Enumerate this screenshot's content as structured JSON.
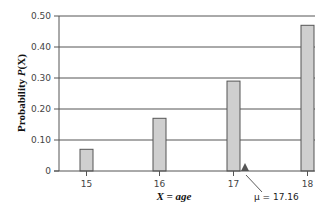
{
  "chart_data": {
    "type": "bar",
    "title": "",
    "xlabel": "X = age",
    "ylabel": "Probability P(X)",
    "categories": [
      "15",
      "16",
      "17",
      "18"
    ],
    "values": [
      0.07,
      0.17,
      0.29,
      0.47
    ],
    "ylim": [
      0,
      0.5
    ],
    "yticks": [
      "0",
      "0.10",
      "0.20",
      "0.30",
      "0.40",
      "0.50"
    ],
    "grid": true,
    "legend": null,
    "annotations": [
      {
        "text": "μ = 17.16",
        "x": 17.16,
        "marker": "triangle-up"
      }
    ]
  },
  "colors": {
    "bar_fill": "#cfcfcf",
    "bar_stroke": "#555555",
    "grid": "#555555",
    "axis": "#555555",
    "marker": "#555555"
  },
  "labels": {
    "ylabel_main": "Probability ",
    "ylabel_var": "P",
    "ylabel_paren": "(X)",
    "xlabel": "X = age",
    "mu": "μ = 17.16"
  }
}
